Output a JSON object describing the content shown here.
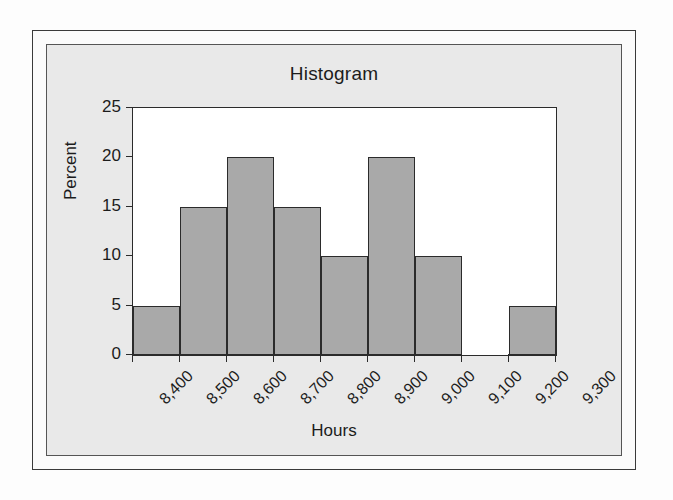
{
  "figure": {
    "title": "Histogram",
    "background_color": "#e9e9e9",
    "plot_background_color": "#ffffff",
    "frame_color": "#3a3a3a"
  },
  "chart_data": {
    "type": "bar",
    "title": "Histogram",
    "subtitle": "",
    "xlabel": "Hours",
    "ylabel": "Percent",
    "grid": false,
    "legend": "none",
    "xlim": [
      8400,
      9300
    ],
    "ylim": [
      0,
      25
    ],
    "x_tick_labels": [
      "8,400",
      "8,500",
      "8,600",
      "8,700",
      "8,800",
      "8,900",
      "9,000",
      "9,100",
      "9,200",
      "9,300"
    ],
    "x_tick_values": [
      8400,
      8500,
      8600,
      8700,
      8800,
      8900,
      9000,
      9100,
      9200,
      9300
    ],
    "y_tick_labels": [
      "0",
      "5",
      "10",
      "15",
      "20",
      "25"
    ],
    "y_tick_values": [
      0,
      5,
      10,
      15,
      20,
      25
    ],
    "bin_width": 100,
    "bar_fill_color": "#a9a9a9",
    "bar_edge_color": "#2b2b2b",
    "bins": [
      {
        "bin_start": 8400,
        "bin_end": 8500,
        "label": "8,400",
        "value": 5
      },
      {
        "bin_start": 8500,
        "bin_end": 8600,
        "label": "8,500",
        "value": 15
      },
      {
        "bin_start": 8600,
        "bin_end": 8700,
        "label": "8,600",
        "value": 20
      },
      {
        "bin_start": 8700,
        "bin_end": 8800,
        "label": "8,700",
        "value": 15
      },
      {
        "bin_start": 8800,
        "bin_end": 8900,
        "label": "8,800",
        "value": 10
      },
      {
        "bin_start": 8900,
        "bin_end": 9000,
        "label": "8,900",
        "value": 20
      },
      {
        "bin_start": 9000,
        "bin_end": 9100,
        "label": "9,000",
        "value": 10
      },
      {
        "bin_start": 9100,
        "bin_end": 9200,
        "label": "9,100",
        "value": 0
      },
      {
        "bin_start": 9200,
        "bin_end": 9300,
        "label": "9,200",
        "value": 5
      }
    ],
    "categories": [
      "8,400",
      "8,500",
      "8,600",
      "8,700",
      "8,800",
      "8,900",
      "9,000",
      "9,100",
      "9,200"
    ],
    "values": [
      5,
      15,
      20,
      15,
      10,
      20,
      10,
      0,
      5
    ]
  }
}
